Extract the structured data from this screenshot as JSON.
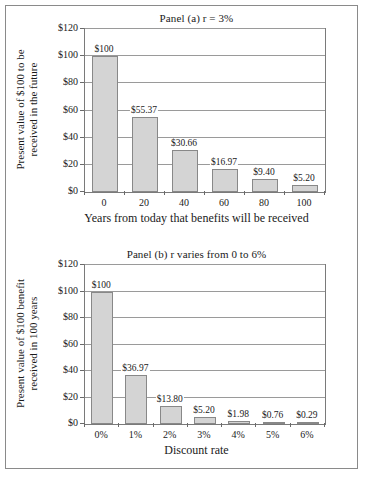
{
  "figure": {
    "panels": [
      {
        "id": "panel-a",
        "title": "Panel (a) r = 3%",
        "ytitle_line1": "Present value of $100 to be",
        "ytitle_line2": "received in the future",
        "xtitle": "Years from today that benefits will be received"
      },
      {
        "id": "panel-b",
        "title": "Panel (b) r varies from 0 to 6%",
        "ytitle_line1": "Present value of $100 benefit",
        "ytitle_line2": "received in 100 years",
        "xtitle": "Discount rate"
      }
    ],
    "bar_fill": "#d4d4d4",
    "bar_stroke": "#888888",
    "frame_stroke": "#8a8a8a"
  },
  "chart_data": [
    {
      "type": "bar",
      "title": "Panel (a) r = 3%",
      "xlabel": "Years from today that benefits will be received",
      "ylabel": "Present value of $100 to be received in the future",
      "categories": [
        "0",
        "20",
        "40",
        "60",
        "80",
        "100"
      ],
      "values": [
        100,
        55.37,
        30.66,
        16.97,
        9.4,
        5.2
      ],
      "data_labels": [
        "$100",
        "$55.37",
        "$30.66",
        "$16.97",
        "$9.40",
        "$5.20"
      ],
      "yticks": [
        0,
        20,
        40,
        60,
        80,
        100,
        120
      ],
      "ytick_labels": [
        "$0",
        "$20",
        "$40",
        "$60",
        "$80",
        "$100",
        "$120"
      ],
      "ylim": [
        0,
        120
      ],
      "grid": true,
      "legend": false
    },
    {
      "type": "bar",
      "title": "Panel (b) r varies from 0 to 6%",
      "xlabel": "Discount rate",
      "ylabel": "Present value of $100 benefit received in 100 years",
      "categories": [
        "0%",
        "1%",
        "2%",
        "3%",
        "4%",
        "5%",
        "6%"
      ],
      "values": [
        100,
        36.97,
        13.8,
        5.2,
        1.98,
        0.76,
        0.29
      ],
      "data_labels": [
        "$100",
        "$36.97",
        "$13.80",
        "$5.20",
        "$1.98",
        "$0.76",
        "$0.29"
      ],
      "yticks": [
        0,
        20,
        40,
        60,
        80,
        100,
        120
      ],
      "ytick_labels": [
        "$0",
        "$20",
        "$40",
        "$60",
        "$80",
        "$100",
        "$120"
      ],
      "ylim": [
        0,
        120
      ],
      "grid": true,
      "legend": false
    }
  ]
}
